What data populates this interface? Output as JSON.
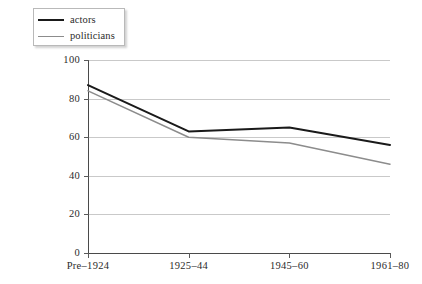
{
  "chart_data": {
    "type": "line",
    "title": "",
    "subtitle": "",
    "xlabel": "",
    "ylabel": "",
    "categories": [
      "Pre–1924",
      "1925–44",
      "1945–60",
      "1961–80"
    ],
    "series": [
      {
        "name": "actors",
        "values": [
          87,
          63,
          65,
          56
        ],
        "color": "#1a1a1a"
      },
      {
        "name": "politicians",
        "values": [
          84,
          60,
          57,
          46
        ],
        "color": "#8c8c8c"
      }
    ],
    "ylim": [
      0,
      100
    ],
    "yticks": [
      0,
      20,
      40,
      60,
      80,
      100
    ],
    "ytick_labels": [
      "0",
      "20",
      "40",
      "60",
      "80",
      "100"
    ],
    "grid": true,
    "grid_axis": "y",
    "legend_position": "top-left",
    "annotations": []
  },
  "legend": {
    "items": [
      {
        "label": "actors"
      },
      {
        "label": "politicians"
      }
    ]
  },
  "axes": {
    "y_tick_labels": [
      "100",
      "80",
      "60",
      "40",
      "20",
      "0"
    ],
    "x_tick_labels": [
      "Pre–1924",
      "1925–44",
      "1945–60",
      "1961–80"
    ]
  },
  "colors": {
    "actors_line": "#1a1a1a",
    "politicians_line": "#8c8c8c",
    "grid": "#c9c9c9",
    "axis": "#4a4a4a",
    "background": "#ffffff"
  }
}
